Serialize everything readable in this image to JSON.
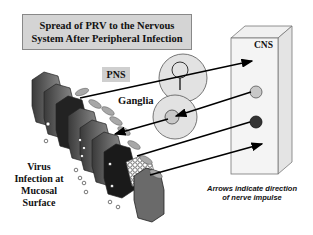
{
  "title": {
    "line1": "Spread of PRV to the Nervous",
    "line2": "System After Peripheral Infection"
  },
  "labels": {
    "pns": "PNS",
    "ganglia": "Ganglia",
    "cns": "CNS",
    "virus_line1": "Virus",
    "virus_line2": "Infection at",
    "virus_line3": "Mucosal",
    "virus_line4": "Surface"
  },
  "note": {
    "line1": "Arrows indicate direction",
    "line2": "of nerve impulse"
  },
  "colors": {
    "title_bg": "#d4d4d4",
    "ganglion_fill": "#e2e2e2",
    "cns_neuron_light": "#c8c8c8",
    "cns_neuron_dark": "#333333",
    "arrow": "#000000"
  },
  "diagram": {
    "ganglia": [
      {
        "id": "ganglion-upper",
        "cx": 183,
        "cy": 78,
        "r": 24
      },
      {
        "id": "ganglion-lower",
        "cx": 175,
        "cy": 117,
        "r": 22
      }
    ],
    "cns_neurons": [
      {
        "id": "cns-neuron-light",
        "cx": 256,
        "cy": 92,
        "r": 6,
        "fill": "light"
      },
      {
        "id": "cns-neuron-dark",
        "cx": 256,
        "cy": 122,
        "r": 6,
        "fill": "dark"
      }
    ],
    "arrows": [
      {
        "id": "arrow-1",
        "direction": "toward CNS"
      },
      {
        "id": "arrow-2",
        "direction": "toward ganglion"
      },
      {
        "id": "arrow-3",
        "direction": "toward mucosa"
      },
      {
        "id": "arrow-4",
        "direction": "toward CNS"
      },
      {
        "id": "arrow-5",
        "direction": "toward CNS"
      }
    ]
  }
}
